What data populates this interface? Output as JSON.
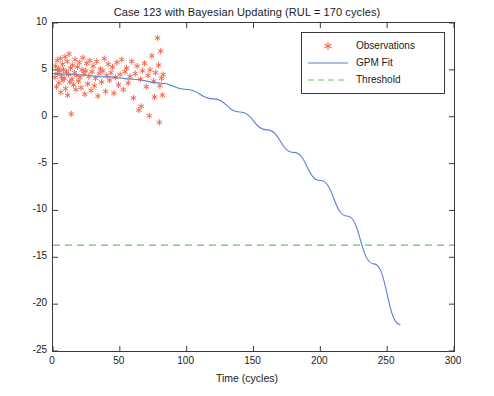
{
  "chart_data": {
    "type": "scatter",
    "title": "Case 123 with Bayesian Updating (RUL = 170 cycles)",
    "xlabel": "Time (cycles)",
    "ylabel": "Parameter Value",
    "xlim": [
      0,
      300
    ],
    "ylim": [
      -25,
      10
    ],
    "xticks": [
      0,
      50,
      100,
      150,
      200,
      250,
      300
    ],
    "yticks": [
      -25,
      -20,
      -15,
      -10,
      -5,
      0,
      5,
      10
    ],
    "grid": false,
    "legend_position": "top-right",
    "legend": [
      {
        "label": "Observations",
        "marker": "*",
        "color": "#f4674b"
      },
      {
        "label": "GPM Fit",
        "color": "#5a7fd4",
        "style": "solid"
      },
      {
        "label": "Threshold",
        "color": "#5cc65c",
        "style": "dashed"
      }
    ],
    "threshold_value": -13.7,
    "series": [
      {
        "name": "Observations",
        "type": "scatter",
        "color": "#f4674b",
        "points": [
          [
            1.5,
            4.2
          ],
          [
            2.0,
            5.4
          ],
          [
            2.6,
            3.2
          ],
          [
            3.1,
            6.0
          ],
          [
            3.5,
            4.6
          ],
          [
            4.0,
            5.1
          ],
          [
            4.4,
            3.6
          ],
          [
            5.0,
            4.9
          ],
          [
            5.4,
            6.2
          ],
          [
            5.9,
            2.6
          ],
          [
            6.4,
            4.3
          ],
          [
            7.0,
            5.6
          ],
          [
            7.4,
            3.9
          ],
          [
            7.9,
            5.0
          ],
          [
            8.4,
            4.1
          ],
          [
            9.0,
            6.4
          ],
          [
            9.5,
            3.0
          ],
          [
            10.0,
            4.8
          ],
          [
            10.6,
            5.9
          ],
          [
            11.0,
            2.3
          ],
          [
            11.5,
            4.5
          ],
          [
            12.0,
            6.7
          ],
          [
            12.6,
            3.7
          ],
          [
            13.1,
            5.2
          ],
          [
            13.6,
            0.3
          ],
          [
            14.2,
            4.0
          ],
          [
            14.8,
            5.5
          ],
          [
            15.3,
            3.4
          ],
          [
            16.0,
            4.7
          ],
          [
            16.5,
            6.1
          ],
          [
            17.1,
            2.9
          ],
          [
            17.8,
            4.4
          ],
          [
            18.4,
            5.3
          ],
          [
            19.0,
            3.8
          ],
          [
            19.6,
            5.8
          ],
          [
            20.2,
            4.2
          ],
          [
            21.0,
            3.1
          ],
          [
            21.7,
            5.0
          ],
          [
            22.4,
            6.3
          ],
          [
            23.1,
            4.6
          ],
          [
            23.8,
            2.4
          ],
          [
            24.5,
            4.9
          ],
          [
            25.2,
            5.7
          ],
          [
            26.0,
            3.5
          ],
          [
            26.8,
            4.3
          ],
          [
            27.6,
            6.0
          ],
          [
            28.4,
            2.8
          ],
          [
            29.2,
            4.8
          ],
          [
            30.0,
            5.4
          ],
          [
            30.9,
            3.3
          ],
          [
            31.8,
            4.1
          ],
          [
            32.7,
            5.9
          ],
          [
            33.6,
            2.2
          ],
          [
            34.5,
            4.6
          ],
          [
            35.4,
            5.1
          ],
          [
            36.4,
            3.7
          ],
          [
            37.3,
            4.9
          ],
          [
            38.3,
            6.2
          ],
          [
            39.3,
            2.7
          ],
          [
            40.3,
            4.4
          ],
          [
            41.3,
            5.6
          ],
          [
            42.4,
            3.9
          ],
          [
            43.4,
            4.7
          ],
          [
            44.5,
            5.3
          ],
          [
            45.6,
            2.5
          ],
          [
            46.7,
            4.2
          ],
          [
            47.8,
            5.8
          ],
          [
            49.0,
            3.4
          ],
          [
            50.2,
            4.5
          ],
          [
            51.4,
            6.1
          ],
          [
            52.6,
            2.9
          ],
          [
            53.8,
            4.8
          ],
          [
            55.0,
            5.2
          ],
          [
            56.3,
            3.6
          ],
          [
            57.6,
            4.3
          ],
          [
            58.9,
            5.9
          ],
          [
            60.2,
            2.0
          ],
          [
            61.5,
            4.6
          ],
          [
            62.9,
            5.4
          ],
          [
            64.2,
            0.7
          ],
          [
            65.6,
            4.0
          ],
          [
            66.0,
            1.1
          ],
          [
            67.0,
            4.9
          ],
          [
            68.4,
            5.7
          ],
          [
            69.8,
            3.2
          ],
          [
            71.2,
            4.4
          ],
          [
            72.0,
            0.1
          ],
          [
            72.6,
            5.0
          ],
          [
            74.0,
            6.5
          ],
          [
            75.4,
            3.8
          ],
          [
            76.0,
            2.1
          ],
          [
            76.8,
            4.7
          ],
          [
            78.2,
            8.4
          ],
          [
            79.0,
            5.5
          ],
          [
            79.6,
            -0.6
          ],
          [
            80.0,
            3.3
          ],
          [
            80.6,
            7.0
          ],
          [
            81.2,
            4.1
          ],
          [
            81.8,
            2.3
          ],
          [
            82.4,
            4.5
          ]
        ]
      },
      {
        "name": "GPM Fit",
        "type": "line",
        "color": "#5a7fd4",
        "x_start": 0,
        "x_end": 260,
        "y_start": 4.6,
        "y_end": -22.2,
        "points": [
          [
            0,
            4.6
          ],
          [
            20,
            4.45
          ],
          [
            40,
            4.25
          ],
          [
            60,
            4.0
          ],
          [
            80,
            3.6
          ],
          [
            100,
            2.9
          ],
          [
            120,
            1.9
          ],
          [
            140,
            0.5
          ],
          [
            160,
            -1.4
          ],
          [
            180,
            -3.8
          ],
          [
            200,
            -6.8
          ],
          [
            220,
            -10.6
          ],
          [
            240,
            -15.7
          ],
          [
            260,
            -22.2
          ]
        ]
      },
      {
        "name": "Threshold",
        "type": "hline",
        "color": "#5cc65c",
        "y": -13.7,
        "x_start": 0,
        "x_end": 300
      }
    ]
  }
}
